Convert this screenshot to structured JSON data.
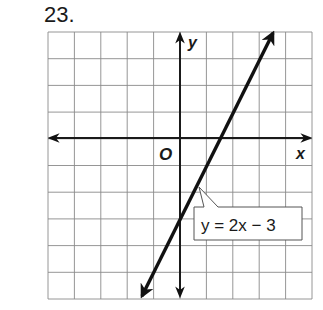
{
  "problem": {
    "number": "23."
  },
  "chart_data": {
    "type": "line",
    "title": "",
    "xlabel": "x",
    "ylabel": "y",
    "origin_label": "O",
    "xlim": [
      -5,
      5
    ],
    "ylim": [
      -6,
      4
    ],
    "grid": true,
    "grid_step": 1,
    "series": [
      {
        "name": "y = 2x − 3",
        "equation": "y = 2x − 3",
        "slope": 2,
        "intercept": -3,
        "x": [
          -1.45,
          3.5
        ],
        "y": [
          -5.9,
          4.0
        ],
        "arrows_both_ends": true
      }
    ],
    "annotations": [
      {
        "text": "y = 2x − 3",
        "points_to": [
          1,
          -1
        ]
      }
    ]
  },
  "colors": {
    "grid": "#8a8a8a",
    "axis": "#1a1a1a",
    "line": "#111111",
    "background": "#ffffff"
  }
}
